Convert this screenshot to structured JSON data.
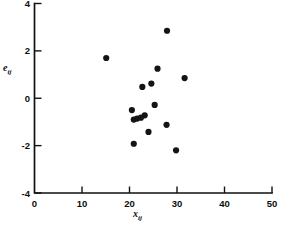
{
  "chart_data": {
    "type": "scatter",
    "title": "",
    "xlabel": "x_ij",
    "ylabel": "e_ij",
    "xlabel_base": "x",
    "xlabel_sub": "ij",
    "ylabel_base": "e",
    "ylabel_sub": "ij",
    "xlim": [
      0,
      50
    ],
    "ylim": [
      -4,
      4
    ],
    "xticks": [
      0,
      10,
      20,
      30,
      40,
      50
    ],
    "yticks": [
      4,
      2,
      0,
      -2,
      -4
    ],
    "xtick_labels": [
      "0",
      "10",
      "20",
      "30",
      "40",
      "50"
    ],
    "ytick_labels": [
      "4",
      "2",
      "0",
      "-2",
      "-4"
    ],
    "grid": false,
    "legend": "none",
    "marker": "filled-circle",
    "marker_color": "#141414",
    "marker_size": 3.1,
    "points": [
      {
        "x": 15.1,
        "y": 1.7
      },
      {
        "x": 27.9,
        "y": 2.85
      },
      {
        "x": 25.9,
        "y": 1.25
      },
      {
        "x": 31.6,
        "y": 0.85
      },
      {
        "x": 24.6,
        "y": 0.62
      },
      {
        "x": 22.7,
        "y": 0.48
      },
      {
        "x": 25.3,
        "y": -0.28
      },
      {
        "x": 20.5,
        "y": -0.5
      },
      {
        "x": 23.2,
        "y": -0.72
      },
      {
        "x": 22.4,
        "y": -0.82
      },
      {
        "x": 21.6,
        "y": -0.86
      },
      {
        "x": 20.9,
        "y": -0.9
      },
      {
        "x": 27.8,
        "y": -1.12
      },
      {
        "x": 24.0,
        "y": -1.42
      },
      {
        "x": 20.9,
        "y": -1.92
      },
      {
        "x": 29.8,
        "y": -2.2
      }
    ]
  }
}
